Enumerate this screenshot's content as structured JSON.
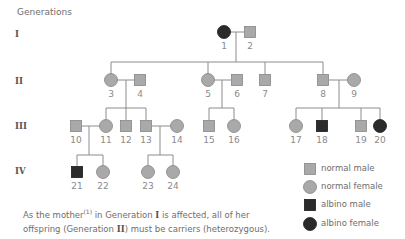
{
  "heading": "Generations",
  "generations": [
    {
      "label": "I",
      "y": 35
    },
    {
      "label": "II",
      "y": 82
    },
    {
      "label": "III",
      "y": 127
    },
    {
      "label": "IV",
      "y": 172
    }
  ],
  "colors": {
    "normal_fill": "#a9a9a9",
    "normal_stroke": "#858585",
    "affected_fill": "#2b2b2b",
    "line": "#8c8c8c",
    "text": "#6e6e6e"
  },
  "individuals": [
    {
      "id": "1",
      "sex": "female",
      "affected": true,
      "x": 224,
      "y": 32
    },
    {
      "id": "2",
      "sex": "male",
      "affected": false,
      "x": 250,
      "y": 32
    },
    {
      "id": "3",
      "sex": "female",
      "affected": false,
      "x": 111,
      "y": 80
    },
    {
      "id": "4",
      "sex": "male",
      "affected": false,
      "x": 140,
      "y": 80
    },
    {
      "id": "5",
      "sex": "female",
      "affected": false,
      "x": 208,
      "y": 80
    },
    {
      "id": "6",
      "sex": "male",
      "affected": false,
      "x": 237,
      "y": 80
    },
    {
      "id": "7",
      "sex": "male",
      "affected": false,
      "x": 265,
      "y": 80
    },
    {
      "id": "8",
      "sex": "male",
      "affected": false,
      "x": 323,
      "y": 80
    },
    {
      "id": "9",
      "sex": "female",
      "affected": false,
      "x": 354,
      "y": 80
    },
    {
      "id": "10",
      "sex": "male",
      "affected": false,
      "x": 76,
      "y": 126
    },
    {
      "id": "11",
      "sex": "female",
      "affected": false,
      "x": 106,
      "y": 126
    },
    {
      "id": "12",
      "sex": "male",
      "affected": false,
      "x": 126,
      "y": 126
    },
    {
      "id": "13",
      "sex": "male",
      "affected": false,
      "x": 146,
      "y": 126
    },
    {
      "id": "14",
      "sex": "female",
      "affected": false,
      "x": 177,
      "y": 126
    },
    {
      "id": "15",
      "sex": "male",
      "affected": false,
      "x": 209,
      "y": 126
    },
    {
      "id": "16",
      "sex": "female",
      "affected": false,
      "x": 234,
      "y": 126
    },
    {
      "id": "17",
      "sex": "female",
      "affected": false,
      "x": 296,
      "y": 126
    },
    {
      "id": "18",
      "sex": "male",
      "affected": true,
      "x": 322,
      "y": 126
    },
    {
      "id": "19",
      "sex": "male",
      "affected": false,
      "x": 361,
      "y": 126
    },
    {
      "id": "20",
      "sex": "female",
      "affected": true,
      "x": 380,
      "y": 126
    },
    {
      "id": "21",
      "sex": "male",
      "affected": true,
      "x": 77,
      "y": 172
    },
    {
      "id": "22",
      "sex": "female",
      "affected": false,
      "x": 103,
      "y": 172
    },
    {
      "id": "23",
      "sex": "female",
      "affected": false,
      "x": 148,
      "y": 172
    },
    {
      "id": "24",
      "sex": "female",
      "affected": false,
      "x": 173,
      "y": 172
    }
  ],
  "lines": [
    [
      230,
      32,
      245,
      32
    ],
    [
      236,
      32,
      236,
      62
    ],
    [
      111,
      62,
      323,
      62
    ],
    [
      111,
      62,
      111,
      74
    ],
    [
      208,
      62,
      208,
      74
    ],
    [
      265,
      62,
      265,
      74
    ],
    [
      323,
      62,
      323,
      74
    ],
    [
      117,
      80,
      135,
      80
    ],
    [
      126,
      80,
      126,
      108
    ],
    [
      106,
      108,
      146,
      108
    ],
    [
      106,
      108,
      106,
      120
    ],
    [
      126,
      108,
      126,
      120
    ],
    [
      146,
      108,
      146,
      120
    ],
    [
      214,
      80,
      231,
      80
    ],
    [
      222,
      80,
      222,
      108
    ],
    [
      209,
      108,
      234,
      108
    ],
    [
      209,
      108,
      209,
      120
    ],
    [
      234,
      108,
      234,
      120
    ],
    [
      329,
      80,
      348,
      80
    ],
    [
      339,
      80,
      339,
      108
    ],
    [
      296,
      108,
      380,
      108
    ],
    [
      296,
      108,
      296,
      120
    ],
    [
      322,
      108,
      322,
      120
    ],
    [
      361,
      108,
      361,
      120
    ],
    [
      380,
      108,
      380,
      120
    ],
    [
      82,
      126,
      100,
      126
    ],
    [
      89,
      126,
      89,
      155
    ],
    [
      77,
      155,
      103,
      155
    ],
    [
      77,
      155,
      77,
      166
    ],
    [
      103,
      155,
      103,
      166
    ],
    [
      152,
      126,
      171,
      126
    ],
    [
      160,
      126,
      160,
      155
    ],
    [
      148,
      155,
      173,
      155
    ],
    [
      148,
      155,
      148,
      166
    ],
    [
      173,
      155,
      173,
      166
    ]
  ],
  "legend": [
    {
      "sex": "male",
      "affected": false,
      "label": "normal male",
      "y": 169
    },
    {
      "sex": "female",
      "affected": false,
      "label": "normal female",
      "y": 187
    },
    {
      "sex": "male",
      "affected": true,
      "label": "albino male",
      "y": 205
    },
    {
      "sex": "female",
      "affected": true,
      "label": "albino female",
      "y": 224
    }
  ],
  "caption": {
    "line1_a": "As the mother",
    "line1_sup": "(1)",
    "line1_b": " in Generation ",
    "line1_gen": "I",
    "line1_c": " is affected, all of her",
    "line2_a": "offspring (Generation ",
    "line2_gen": "II",
    "line2_b": ") must be carriers (heterozygous)."
  }
}
